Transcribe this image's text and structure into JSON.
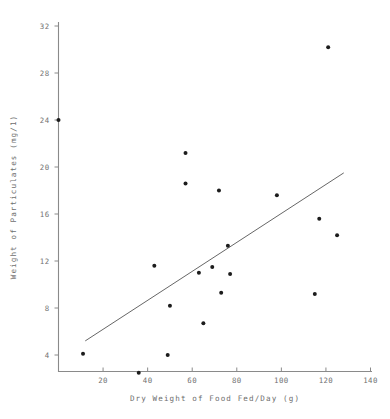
{
  "chart_data": {
    "type": "scatter",
    "title": "",
    "xlabel": "Dry Weight of Food Fed/Day (g)",
    "ylabel": "Weight of Particulates (mg/1)",
    "xlim": [
      0,
      140
    ],
    "ylim": [
      0,
      32
    ],
    "grid": false,
    "legend": null,
    "xticks": [
      20,
      40,
      60,
      80,
      100,
      120,
      140
    ],
    "xtick_labels": [
      "20",
      "40",
      "60",
      "80",
      "100",
      "120",
      "140"
    ],
    "yticks": [
      4,
      8,
      12,
      16,
      20,
      24,
      28,
      32
    ],
    "ytick_labels": [
      "4",
      "8",
      "12",
      "16",
      "20",
      "24",
      "28",
      "32"
    ],
    "points": [
      {
        "x": 0,
        "y": 24.0
      },
      {
        "x": 11,
        "y": 4.1
      },
      {
        "x": 36,
        "y": 2.5
      },
      {
        "x": 43,
        "y": 11.6
      },
      {
        "x": 49,
        "y": 4.0
      },
      {
        "x": 50,
        "y": 8.2
      },
      {
        "x": 57,
        "y": 21.2
      },
      {
        "x": 57,
        "y": 18.6
      },
      {
        "x": 63,
        "y": 11.0
      },
      {
        "x": 65,
        "y": 6.7
      },
      {
        "x": 69,
        "y": 11.5
      },
      {
        "x": 72,
        "y": 18.0
      },
      {
        "x": 73,
        "y": 9.3
      },
      {
        "x": 76,
        "y": 13.3
      },
      {
        "x": 77,
        "y": 10.9
      },
      {
        "x": 98,
        "y": 17.6
      },
      {
        "x": 115,
        "y": 9.2
      },
      {
        "x": 117,
        "y": 15.6
      },
      {
        "x": 121,
        "y": 30.2
      },
      {
        "x": 125,
        "y": 14.2
      }
    ],
    "trendline": {
      "name": "linear fit",
      "x_start": 12,
      "y_start": 5.2,
      "x_end": 128,
      "y_end": 19.5
    },
    "colors": {
      "point": "#1c1c1c",
      "line": "#555555",
      "axis": "#8a8a8a",
      "text": "#6e6e6e",
      "background": "#ffffff"
    }
  }
}
